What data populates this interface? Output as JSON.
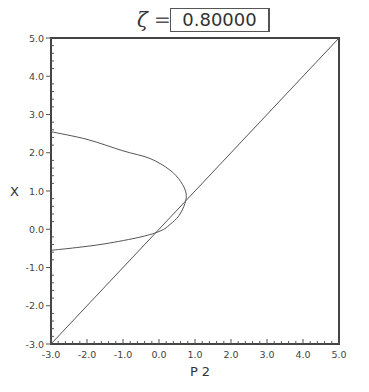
{
  "header": {
    "symbol": "ζ",
    "equals": "=",
    "value": "0.80000"
  },
  "chart_data": {
    "type": "line",
    "title": "ζ = 0.80000",
    "xlabel": "P 2",
    "ylabel": "X",
    "xlim": [
      -3.0,
      5.0
    ],
    "ylim": [
      -3.0,
      5.0
    ],
    "grid": false,
    "legend": null,
    "x_ticks": [
      "-3.0",
      "-2.0",
      "-1.0",
      "0.0",
      "1.0",
      "2.0",
      "3.0",
      "4.0",
      "5.0"
    ],
    "y_ticks": [
      "-3.0",
      "-2.0",
      "-1.0",
      "0.0",
      "1.0",
      "2.0",
      "3.0",
      "4.0",
      "5.0"
    ],
    "series": [
      {
        "name": "identity line X = P2",
        "points": [
          [
            -3.0,
            -3.0
          ],
          [
            5.0,
            5.0
          ]
        ]
      },
      {
        "name": "curve",
        "points": [
          [
            -3.0,
            2.55
          ],
          [
            -2.0,
            2.35
          ],
          [
            -1.0,
            2.05
          ],
          [
            -0.25,
            1.85
          ],
          [
            0.3,
            1.55
          ],
          [
            0.6,
            1.25
          ],
          [
            0.75,
            0.95
          ],
          [
            0.72,
            0.67
          ],
          [
            0.55,
            0.35
          ],
          [
            0.3,
            0.12
          ],
          [
            0.05,
            -0.04
          ],
          [
            -0.5,
            -0.2
          ],
          [
            -1.5,
            -0.38
          ],
          [
            -2.3,
            -0.48
          ],
          [
            -3.0,
            -0.55
          ]
        ]
      }
    ]
  }
}
